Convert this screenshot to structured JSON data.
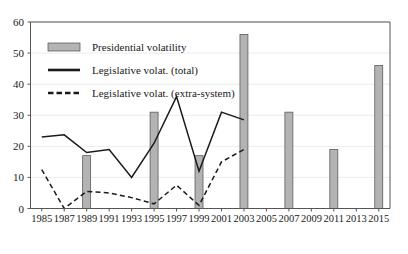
{
  "chart_data": {
    "type": "bar",
    "title": "",
    "xlabel": "",
    "ylabel": "",
    "ylim": [
      0,
      60
    ],
    "yticks": [
      0,
      10,
      20,
      30,
      40,
      50,
      60
    ],
    "ytick_labels": [
      "0",
      "10",
      "20",
      "30",
      "40",
      "50",
      "60"
    ],
    "grid": true,
    "legend_position": "upper-left-inside",
    "categories": [
      "1985",
      "1987",
      "1989",
      "1991",
      "1993",
      "1995",
      "1997",
      "1999",
      "2001",
      "2003",
      "2005",
      "2007",
      "2009",
      "2011",
      "2013",
      "2015"
    ],
    "series": [
      {
        "name": "Presidential volatility",
        "type": "bar",
        "color": "#b3b3b3",
        "edge_color": "#4d4d4d",
        "values": [
          null,
          null,
          17,
          null,
          null,
          31,
          null,
          17,
          null,
          56,
          null,
          31,
          null,
          19,
          null,
          46
        ]
      },
      {
        "name": "Legislative volat. (total)",
        "type": "line",
        "style": "solid",
        "color": "#1a1a1a",
        "values": [
          23,
          23.7,
          18,
          19,
          10,
          21,
          36,
          12,
          31,
          28.5,
          null,
          null,
          null,
          null,
          null,
          null
        ]
      },
      {
        "name": "Legislative volat. (extra-system)",
        "type": "line",
        "style": "dashed",
        "color": "#1a1a1a",
        "values": [
          12.5,
          0,
          5.5,
          5,
          3.5,
          1.5,
          7.5,
          1,
          15,
          19,
          null,
          null,
          null,
          null,
          null,
          null
        ]
      }
    ]
  },
  "legend": {
    "items": [
      {
        "label": "Presidential volatility",
        "marker": "bar-swatch"
      },
      {
        "label": "Legislative volat. (total)",
        "marker": "solid-line"
      },
      {
        "label": "Legislative volat. (extra-system)",
        "marker": "dashed-line"
      }
    ]
  },
  "axes": {
    "y_tick_labels": [
      "0",
      "10",
      "20",
      "30",
      "40",
      "50",
      "60"
    ],
    "x_tick_labels": [
      "1985",
      "1987",
      "1989",
      "1991",
      "1993",
      "1995",
      "1997",
      "1999",
      "2001",
      "2003",
      "2005",
      "2007",
      "2009",
      "2011",
      "2013",
      "2015"
    ]
  },
  "colors": {
    "bar_fill": "#b3b3b3",
    "bar_edge": "#4d4d4d",
    "line": "#1a1a1a",
    "grid": "#e6e6e6",
    "axis": "#555555",
    "background": "#ffffff"
  }
}
